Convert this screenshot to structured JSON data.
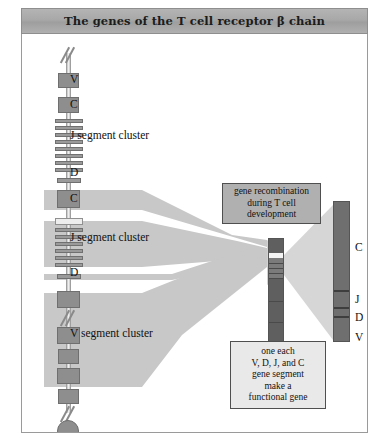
{
  "title": "The genes of the T cell receptor β chain",
  "chromosome": {
    "labels": [
      {
        "text": "V",
        "x": 70,
        "y": 44
      },
      {
        "text": "C",
        "x": 70,
        "y": 69
      },
      {
        "text": "J segment cluster",
        "x": 70,
        "y": 100
      },
      {
        "text": "D",
        "x": 70,
        "y": 137
      },
      {
        "text": "C",
        "x": 70,
        "y": 163
      },
      {
        "text": "J segment cluster",
        "x": 70,
        "y": 202
      },
      {
        "text": "D",
        "x": 70,
        "y": 236
      },
      {
        "text": "V segment cluster",
        "x": 70,
        "y": 298
      }
    ]
  },
  "recombination_box": {
    "lines": [
      "gene recombination",
      "during T cell",
      "development"
    ]
  },
  "functional_gene_box": {
    "lines": [
      "one each",
      "V, D, J, and C",
      "gene segment",
      "make a",
      "functional gene"
    ]
  },
  "final_gene_bar": {
    "segment_labels": [
      {
        "text": "C",
        "x": 334,
        "y": 212
      },
      {
        "text": "J",
        "x": 334,
        "y": 270
      },
      {
        "text": "D",
        "x": 334,
        "y": 288
      },
      {
        "text": "V",
        "x": 334,
        "y": 308
      }
    ]
  },
  "colors": {
    "gene_box": "#8e8e8e",
    "band": "#c8c8c8",
    "bar_dark": "#6f6f6f",
    "title_bar": "#a8a8a8",
    "frame_border": "#9a9a9a"
  }
}
